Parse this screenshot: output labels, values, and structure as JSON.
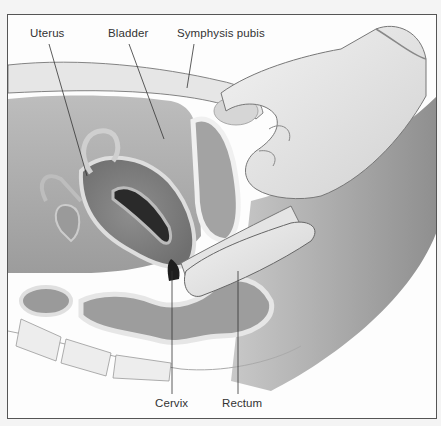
{
  "figure": {
    "type": "anatomical-illustration",
    "labels": {
      "uterus": "Uterus",
      "bladder": "Bladder",
      "symphysis_pubis": "Symphysis pubis",
      "cervix": "Cervix",
      "rectum": "Rectum"
    },
    "colors": {
      "frame_border": "#555555",
      "background": "#fdfdfd",
      "tissue_dark": "#8a8a8a",
      "tissue_mid": "#b4b4b4",
      "tissue_light": "#dcdcdc",
      "glove": "#e9e9e9",
      "leader_line": "#333333"
    }
  }
}
